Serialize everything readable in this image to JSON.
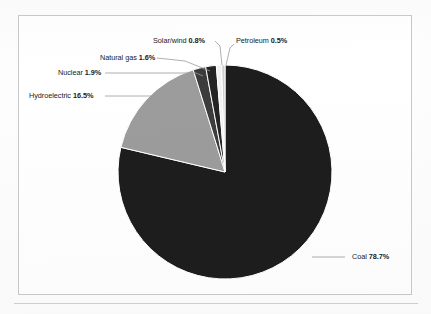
{
  "chart_data": {
    "type": "pie",
    "title": "",
    "subtitle": "",
    "xlabel": "",
    "ylabel": "",
    "legend_position": "none",
    "labels_position": "outside-with-leader-lines",
    "grid": false,
    "unit": "%",
    "start_angle_deg": 0,
    "direction": "clockwise",
    "categories": [
      "Coal",
      "Hydroelectric",
      "Nuclear",
      "Natural gas",
      "Solar/wind",
      "Petroleum"
    ],
    "values": [
      78.7,
      16.5,
      1.9,
      1.6,
      0.8,
      0.5
    ],
    "slices": [
      {
        "name": "Coal",
        "label_category": "Coal",
        "label_value": "78.7%",
        "value": 78.7,
        "color": "#1d1d1d",
        "start_deg": 0,
        "sweep_deg": 283.32,
        "label_x": 352,
        "label_y": 257,
        "label_anchor": "start",
        "leader": [
          [
            312,
            257
          ],
          [
            345,
            257
          ]
        ]
      },
      {
        "name": "Hydroelectric",
        "label_category": "Hydroelectric",
        "label_value": "16.5%",
        "value": 16.5,
        "color": "#9c9c9c",
        "start_deg": 283.32,
        "sweep_deg": 59.4,
        "label_x": 29,
        "label_y": 96,
        "label_anchor": "start",
        "leader": [
          [
            105,
            96
          ],
          [
            152,
            96
          ],
          [
            160,
            100
          ]
        ]
      },
      {
        "name": "Nuclear",
        "label_category": "Nuclear",
        "label_value": "1.9%",
        "value": 1.9,
        "color": "#3c3c3c",
        "start_deg": 342.72,
        "sweep_deg": 6.84,
        "label_x": 58,
        "label_y": 73,
        "label_anchor": "start",
        "leader": [
          [
            105,
            73
          ],
          [
            196,
            73
          ],
          [
            203,
            76
          ]
        ]
      },
      {
        "name": "Natural gas",
        "label_category": "Natural gas",
        "label_value": "1.6%",
        "value": 1.6,
        "color": "#242424",
        "start_deg": 349.56,
        "sweep_deg": 5.76,
        "label_x": 100,
        "label_y": 58,
        "label_anchor": "start",
        "leader": [
          [
            157,
            58
          ],
          [
            185,
            61
          ],
          [
            210,
            71
          ]
        ]
      },
      {
        "name": "Solar/wind",
        "label_category": "Solar/wind",
        "label_value": "0.8%",
        "value": 0.8,
        "color": "#f2f2f2",
        "start_deg": 355.32,
        "sweep_deg": 2.88,
        "label_x": 153,
        "label_y": 41,
        "label_anchor": "start",
        "leader": [
          [
            215,
            41
          ],
          [
            220,
            46
          ],
          [
            222,
            65
          ]
        ]
      },
      {
        "name": "Petroleum",
        "label_category": "Petroleum",
        "label_value": "0.5%",
        "value": 0.5,
        "color": "#cfcfcf",
        "start_deg": 358.2,
        "sweep_deg": 1.8,
        "label_x": 236,
        "label_y": 41,
        "label_anchor": "start",
        "leader": [
          [
            234,
            44
          ],
          [
            230,
            48
          ],
          [
            226,
            65
          ]
        ]
      }
    ],
    "geometry": {
      "center_x": 225,
      "center_y": 172,
      "radius": 107
    }
  },
  "figure": {
    "frame_color": "#c9c9c9",
    "background": "#ffffff",
    "leader_line_color": "#9a9a9a",
    "text_color": "#1b1b1b"
  }
}
